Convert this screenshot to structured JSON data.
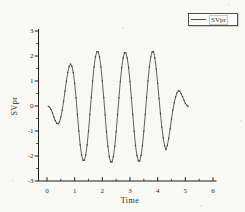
{
  "figure": {
    "background": "#f8f8f5",
    "colors": {
      "curve": "#3b3b3b",
      "marker": "#2e2e2e",
      "axis": "#1f1f1f",
      "text": "#2a2a2a",
      "legend_border": "#4f4f4c"
    },
    "legend": {
      "label": "SVpr"
    },
    "axes": {
      "x": {
        "title": "Time",
        "min": 0,
        "max": 6,
        "major_ticks": [
          0,
          1,
          2,
          3,
          4,
          5,
          6
        ],
        "minor_step": 0.5
      },
      "y": {
        "title": "SVpr",
        "min": -3,
        "max": 3,
        "major_ticks": [
          3,
          2,
          1,
          0,
          -1,
          -2,
          -3
        ],
        "minor_step": 0.5
      }
    }
  },
  "chart_data": {
    "type": "line",
    "title": "",
    "xlabel": "Time",
    "ylabel": "SVpr",
    "xlim": [
      0,
      6
    ],
    "ylim": [
      -3,
      3
    ],
    "grid": false,
    "legend_position": "top-right",
    "legend": [
      "SVpr"
    ],
    "series": [
      {
        "name": "SVpr",
        "x": [
          0.05,
          0.1,
          0.15,
          0.2,
          0.25,
          0.3,
          0.35,
          0.4,
          0.45,
          0.5,
          0.55,
          0.6,
          0.65,
          0.7,
          0.75,
          0.8,
          0.85,
          0.9,
          0.95,
          1.0,
          1.05,
          1.1,
          1.15,
          1.2,
          1.25,
          1.3,
          1.35,
          1.4,
          1.45,
          1.5,
          1.55,
          1.6,
          1.65,
          1.7,
          1.75,
          1.8,
          1.85,
          1.9,
          1.95,
          2.0,
          2.05,
          2.1,
          2.15,
          2.2,
          2.25,
          2.3,
          2.35,
          2.4,
          2.45,
          2.5,
          2.55,
          2.6,
          2.65,
          2.7,
          2.75,
          2.8,
          2.85,
          2.9,
          2.95,
          3.0,
          3.05,
          3.1,
          3.15,
          3.2,
          3.25,
          3.3,
          3.35,
          3.4,
          3.45,
          3.5,
          3.55,
          3.6,
          3.65,
          3.7,
          3.75,
          3.8,
          3.85,
          3.9,
          3.95,
          4.0,
          4.05,
          4.1,
          4.15,
          4.2,
          4.25,
          4.3,
          4.35,
          4.4,
          4.45,
          4.5,
          4.55,
          4.6,
          4.65,
          4.7,
          4.75,
          4.8,
          4.85,
          4.9,
          4.95,
          5.0,
          5.05,
          5.1
        ],
        "y": [
          -0.02,
          -0.06,
          -0.14,
          -0.28,
          -0.45,
          -0.59,
          -0.69,
          -0.71,
          -0.64,
          -0.45,
          -0.17,
          0.19,
          0.59,
          0.99,
          1.34,
          1.58,
          1.68,
          1.6,
          1.34,
          0.91,
          0.33,
          -0.34,
          -1.0,
          -1.56,
          -1.96,
          -2.17,
          -2.17,
          -1.96,
          -1.56,
          -1.0,
          -0.34,
          0.34,
          1.0,
          1.56,
          1.96,
          2.17,
          2.17,
          1.96,
          1.56,
          1.0,
          0.34,
          -0.35,
          -1.03,
          -1.61,
          -2.02,
          -2.24,
          -2.24,
          -2.02,
          -1.61,
          -1.03,
          -0.35,
          0.33,
          0.98,
          1.53,
          1.92,
          2.13,
          2.13,
          1.92,
          1.53,
          0.98,
          0.33,
          -0.34,
          -1.01,
          -1.58,
          -1.98,
          -2.2,
          -2.2,
          -1.98,
          -1.58,
          -1.01,
          -0.34,
          0.34,
          1.0,
          1.56,
          1.96,
          2.17,
          2.17,
          1.92,
          1.48,
          0.91,
          0.3,
          -0.3,
          -0.84,
          -1.27,
          -1.59,
          -1.74,
          -1.58,
          -1.29,
          -0.92,
          -0.52,
          -0.16,
          0.14,
          0.36,
          0.53,
          0.61,
          0.59,
          0.49,
          0.37,
          0.23,
          0.11,
          0.03,
          -0.02
        ]
      }
    ]
  }
}
